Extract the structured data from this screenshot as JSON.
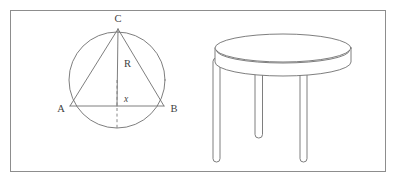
{
  "figure": {
    "width": 397,
    "height": 182,
    "background_color": "#ffffff",
    "frame": {
      "stroke_color": "#8d8d8d",
      "x": 10.5,
      "y": 10.5,
      "width": 375,
      "height": 161
    }
  },
  "diagram": {
    "caption": "Circle with inscribed triangle ABC beside a round three-legged table",
    "stroke_color": "#6f6f6f",
    "circle": {
      "center_x": 117,
      "center_y": 80,
      "radius": 48
    },
    "points": {
      "A": {
        "x": 70,
        "y": 106
      },
      "B": {
        "x": 164,
        "y": 106
      },
      "C": {
        "x": 118,
        "y": 29
      },
      "center": {
        "x": 117,
        "y": 106
      }
    },
    "labels": [
      {
        "id": "label-C",
        "text": "C",
        "x": 118,
        "y": 22
      },
      {
        "id": "label-R",
        "text": "R",
        "x": 124,
        "y": 63
      },
      {
        "id": "label-x",
        "text": "x",
        "x": 124,
        "y": 99
      },
      {
        "id": "label-A",
        "text": "A",
        "x": 61,
        "y": 112
      },
      {
        "id": "label-B",
        "text": "B",
        "x": 172,
        "y": 112
      }
    ],
    "segments": [
      {
        "id": "side-AC",
        "from": "A",
        "to": "C"
      },
      {
        "id": "side-BC",
        "from": "B",
        "to": "C"
      },
      {
        "id": "side-AB",
        "from": "A",
        "to": "B"
      },
      {
        "id": "radius-C-center",
        "from": "C",
        "to": "center"
      }
    ],
    "dashed_segment": {
      "id": "apothem-dashed",
      "from_y": 80,
      "to_y": 128,
      "x": 117
    }
  },
  "table": {
    "name": "round-three-legged-table",
    "stroke_color": "#6f6f6f",
    "fill_color": "#ffffff",
    "top": {
      "center_x": 283,
      "top_ellipse_cy": 48,
      "rx": 68,
      "ry": 14,
      "thickness": 14
    },
    "legs": [
      {
        "id": "leg-front-left",
        "x": 213,
        "y_top": 66,
        "width": 7,
        "height": 96
      },
      {
        "id": "leg-back-center",
        "x": 255,
        "y_top": 64,
        "width": 7.5,
        "height": 74
      },
      {
        "id": "leg-front-right",
        "x": 300,
        "y_top": 66,
        "width": 7,
        "height": 96
      }
    ]
  }
}
